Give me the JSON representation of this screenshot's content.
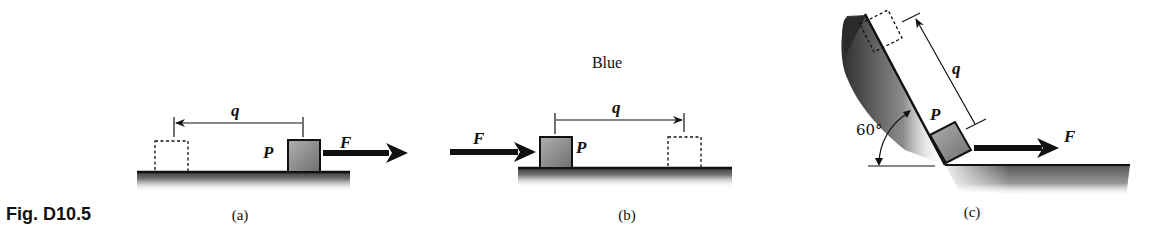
{
  "figure": {
    "label": "Fig. D10.5",
    "title": "Blue"
  },
  "panels": [
    {
      "id": "a",
      "caption": "(a)",
      "displacement_label": "q",
      "point_label": "P",
      "force_label": "F",
      "force_direction": "right",
      "displacement_direction": "left"
    },
    {
      "id": "b",
      "caption": "(b)",
      "displacement_label": "q",
      "point_label": "P",
      "force_label": "F",
      "force_direction": "right",
      "displacement_direction": "right"
    },
    {
      "id": "c",
      "caption": "(c)",
      "displacement_label": "q",
      "point_label": "P",
      "force_label": "F",
      "force_direction": "right",
      "displacement_direction": "up-slope",
      "angle_label": "60°"
    }
  ],
  "colors": {
    "ink": "#111111",
    "block_fill": "#8a8a8a",
    "ground_shade": "#6a6a6a",
    "background": "#ffffff"
  }
}
